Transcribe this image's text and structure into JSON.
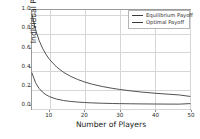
{
  "chart_data": {
    "type": "line",
    "title": "",
    "xlabel": "Number of Players",
    "ylabel": "Individual Payoff",
    "xlim": [
      5,
      50
    ],
    "ylim": [
      -0.05,
      1.05
    ],
    "xticks": [
      "10",
      "20",
      "30",
      "40",
      "50"
    ],
    "xtick_values": [
      10,
      20,
      30,
      40,
      50
    ],
    "yticks": [
      "0.0",
      "0.2",
      "0.4",
      "0.6",
      "0.8",
      "1.0"
    ],
    "ytick_values": [
      0.0,
      0.2,
      0.4,
      0.6,
      0.8,
      1.0
    ],
    "grid": true,
    "legend_position": "upper right",
    "x": [
      5,
      6,
      7,
      8,
      9,
      10,
      12,
      14,
      16,
      18,
      20,
      22,
      25,
      28,
      30,
      33,
      36,
      40,
      44,
      47,
      50
    ],
    "series": [
      {
        "name": "Equilibrium Payoff",
        "color": "#3b3b3b",
        "values": [
          1.0,
          0.833,
          0.714,
          0.625,
          0.556,
          0.5,
          0.417,
          0.357,
          0.313,
          0.278,
          0.25,
          0.227,
          0.2,
          0.179,
          0.167,
          0.152,
          0.139,
          0.125,
          0.114,
          0.106,
          0.09
        ]
      },
      {
        "name": "Optimal Payoff",
        "color": "#3b3b3b",
        "values": [
          0.35,
          0.243,
          0.179,
          0.137,
          0.108,
          0.087,
          0.06,
          0.044,
          0.034,
          0.027,
          0.022,
          0.018,
          0.014,
          0.011,
          0.0097,
          0.008,
          0.0067,
          0.0055,
          0.0045,
          0.004,
          0.01
        ]
      }
    ]
  },
  "legend": {
    "items": [
      {
        "label": "Equilibrium Payoff"
      },
      {
        "label": "Optimal Payoff"
      }
    ]
  }
}
